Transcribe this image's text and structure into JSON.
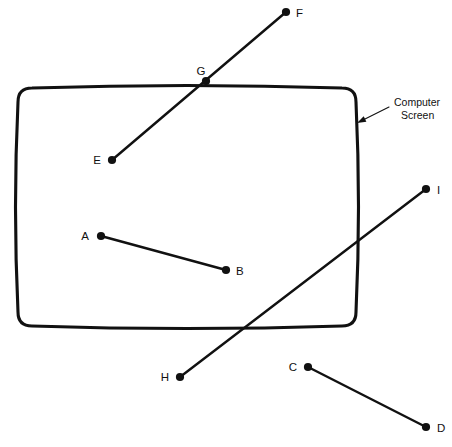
{
  "figure": {
    "background_color": "#ffffff",
    "ink_color": "#111111",
    "width": 452,
    "height": 447
  },
  "callout": {
    "name": "computer-screen-callout",
    "line1": "Computer",
    "line2": "Screen",
    "arrow_from": {
      "x": 389,
      "y": 107
    },
    "arrow_to": {
      "x": 357,
      "y": 123
    },
    "text_x": 394,
    "text_y1": 106,
    "text_y2": 119
  },
  "screen": {
    "name": "computer-screen-outline",
    "left": 18,
    "top": 88,
    "right": 356,
    "bottom": 326,
    "corner_radius": 14,
    "bulge": 5
  },
  "points": [
    {
      "id": "A",
      "label": "A",
      "x": 101,
      "y": 236,
      "label_x": 89,
      "label_y": 236,
      "label_anchor": "end"
    },
    {
      "id": "B",
      "label": "B",
      "x": 226,
      "y": 270,
      "label_x": 236,
      "label_y": 271,
      "label_anchor": "start"
    },
    {
      "id": "C",
      "label": "C",
      "x": 308,
      "y": 367,
      "label_x": 297,
      "label_y": 367,
      "label_anchor": "end"
    },
    {
      "id": "D",
      "label": "D",
      "x": 426,
      "y": 427,
      "label_x": 437,
      "label_y": 428,
      "label_anchor": "start"
    },
    {
      "id": "E",
      "label": "E",
      "x": 112,
      "y": 160,
      "label_x": 101,
      "label_y": 160,
      "label_anchor": "end"
    },
    {
      "id": "F",
      "label": "F",
      "x": 286,
      "y": 12,
      "label_x": 296,
      "label_y": 13,
      "label_anchor": "start"
    },
    {
      "id": "G",
      "label": "G",
      "x": 206,
      "y": 81,
      "label_x": 201,
      "label_y": 71,
      "label_anchor": "middle"
    },
    {
      "id": "H",
      "label": "H",
      "x": 180,
      "y": 377,
      "label_x": 169,
      "label_y": 377,
      "label_anchor": "end"
    },
    {
      "id": "I",
      "label": "I",
      "x": 426,
      "y": 189,
      "label_x": 437,
      "label_y": 190,
      "label_anchor": "start"
    }
  ],
  "segments": [
    {
      "id": "AB",
      "name": "segment-a-b",
      "from": "A",
      "to": "B",
      "x1": 101,
      "y1": 236,
      "x2": 226,
      "y2": 270
    },
    {
      "id": "CD",
      "name": "segment-c-d",
      "from": "C",
      "to": "D",
      "x1": 308,
      "y1": 367,
      "x2": 426,
      "y2": 427
    },
    {
      "id": "EF",
      "name": "segment-e-f",
      "from": "E",
      "to": "F",
      "x1": 112,
      "y1": 160,
      "x2": 286,
      "y2": 12
    },
    {
      "id": "HI",
      "name": "segment-h-i",
      "from": "H",
      "to": "I",
      "x1": 180,
      "y1": 377,
      "x2": 426,
      "y2": 189
    }
  ],
  "dot_radius": 4.1
}
